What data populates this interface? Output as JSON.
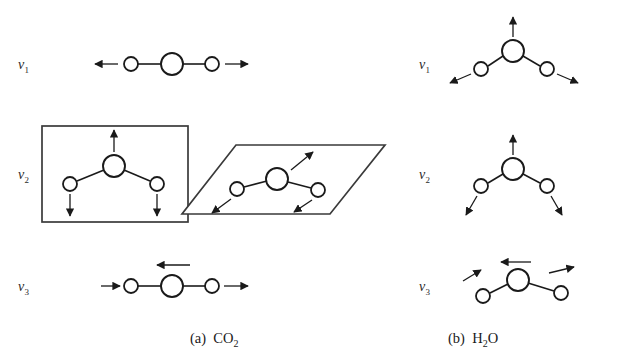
{
  "figure": {
    "panels": [
      {
        "id": "panel-a",
        "caption_prefix": "(a)",
        "molecule_formula": "CO",
        "molecule_sub": "2",
        "geometry": "linear",
        "modes": [
          {
            "label_nu": "ν",
            "label_sub": "1",
            "name": "symmetric-stretch",
            "atoms": [
              {
                "role": "outer",
                "cx": 131,
                "cy": 64,
                "r": 7
              },
              {
                "role": "center",
                "cx": 172,
                "cy": 64,
                "r": 11
              },
              {
                "role": "outer",
                "cx": 212,
                "cy": 64,
                "r": 7
              }
            ],
            "bonds": [
              [
                138,
                64,
                161,
                64
              ],
              [
                183,
                64,
                205,
                64
              ]
            ],
            "arrows": [
              {
                "x1": 118,
                "y1": 64,
                "x2": 95,
                "y2": 64
              },
              {
                "x1": 225,
                "y1": 64,
                "x2": 248,
                "y2": 64
              }
            ],
            "boxes": []
          },
          {
            "label_nu": "ν",
            "label_sub": "2",
            "name": "bend-degenerate-pair",
            "atoms": [
              {
                "role": "outer",
                "cx": 70,
                "cy": 184,
                "r": 7
              },
              {
                "role": "center",
                "cx": 114,
                "cy": 166,
                "r": 11
              },
              {
                "role": "outer",
                "cx": 157,
                "cy": 184,
                "r": 7
              }
            ],
            "bonds": [
              [
                77,
                181,
                104,
                170
              ],
              [
                124,
                170,
                150,
                181
              ]
            ],
            "arrows": [
              {
                "x1": 114,
                "y1": 152,
                "x2": 114,
                "y2": 128
              },
              {
                "x1": 70,
                "y1": 194,
                "x2": 70,
                "y2": 217
              },
              {
                "x1": 157,
                "y1": 194,
                "x2": 157,
                "y2": 217
              }
            ],
            "boxes": [
              {
                "type": "rect",
                "x": 42,
                "y": 126,
                "w": 146,
                "h": 96
              }
            ],
            "second": {
              "name": "bend-perpendicular-plane",
              "atoms": [
                {
                  "role": "outer",
                  "cx": 237,
                  "cy": 189,
                  "r": 7
                },
                {
                  "role": "center",
                  "cx": 277,
                  "cy": 179,
                  "r": 11
                },
                {
                  "role": "outer",
                  "cx": 318,
                  "cy": 190,
                  "r": 7
                }
              ],
              "bonds": [
                [
                  244,
                  187,
                  267,
                  181
                ],
                [
                  288,
                  182,
                  311,
                  188
                ]
              ],
              "arrows": [
                {
                  "x1": 291,
                  "y1": 170,
                  "x2": 313,
                  "y2": 152
                },
                {
                  "x1": 231,
                  "y1": 199,
                  "x2": 212,
                  "y2": 214
                },
                {
                  "x1": 312,
                  "y1": 200,
                  "x2": 294,
                  "y2": 213
                }
              ],
              "boxes": [
                {
                  "type": "parallelogram",
                  "points": "236,145 385,145 330,214 182,214"
                }
              ]
            }
          },
          {
            "label_nu": "ν",
            "label_sub": "3",
            "name": "asymmetric-stretch",
            "atoms": [
              {
                "role": "outer",
                "cx": 131,
                "cy": 286,
                "r": 7
              },
              {
                "role": "center",
                "cx": 172,
                "cy": 286,
                "r": 11
              },
              {
                "role": "outer",
                "cx": 212,
                "cy": 286,
                "r": 7
              }
            ],
            "bonds": [
              [
                138,
                286,
                161,
                286
              ],
              [
                183,
                286,
                205,
                286
              ]
            ],
            "arrows": [
              {
                "x1": 103,
                "y1": 286,
                "x2": 120,
                "y2": 286
              },
              {
                "x1": 190,
                "y1": 265,
                "x2": 156,
                "y2": 265
              },
              {
                "x1": 224,
                "y1": 286,
                "x2": 248,
                "y2": 286
              }
            ],
            "boxes": []
          }
        ]
      },
      {
        "id": "panel-b",
        "caption_prefix": "(b)",
        "molecule_formula": "H",
        "molecule_sub": "2",
        "molecule_formula_tail": "O",
        "geometry": "bent",
        "modes": [
          {
            "label_nu": "ν",
            "label_sub": "1",
            "name": "symmetric-stretch",
            "atoms": [
              {
                "role": "outer",
                "cx": 481,
                "cy": 69,
                "r": 7
              },
              {
                "role": "center",
                "cx": 513,
                "cy": 51,
                "r": 11
              },
              {
                "role": "outer",
                "cx": 547,
                "cy": 69,
                "r": 7
              }
            ],
            "bonds": [
              [
                488,
                66,
                503,
                56
              ],
              [
                523,
                56,
                540,
                66
              ]
            ],
            "arrows": [
              {
                "x1": 513,
                "y1": 37,
                "x2": 513,
                "y2": 16
              },
              {
                "x1": 471,
                "y1": 74,
                "x2": 450,
                "y2": 83
              },
              {
                "x1": 557,
                "y1": 74,
                "x2": 578,
                "y2": 83
              }
            ]
          },
          {
            "label_nu": "ν",
            "label_sub": "2",
            "name": "bend",
            "atoms": [
              {
                "role": "outer",
                "cx": 481,
                "cy": 186,
                "r": 7
              },
              {
                "role": "center",
                "cx": 513,
                "cy": 169,
                "r": 11
              },
              {
                "role": "outer",
                "cx": 547,
                "cy": 186,
                "r": 7
              }
            ],
            "bonds": [
              [
                488,
                183,
                503,
                174
              ],
              [
                523,
                174,
                540,
                183
              ]
            ],
            "arrows": [
              {
                "x1": 513,
                "y1": 155,
                "x2": 513,
                "y2": 134
              },
              {
                "x1": 477,
                "y1": 196,
                "x2": 465,
                "y2": 216
              },
              {
                "x1": 551,
                "y1": 196,
                "x2": 563,
                "y2": 216
              }
            ]
          },
          {
            "label_nu": "ν",
            "label_sub": "3",
            "name": "asymmetric-stretch",
            "atoms": [
              {
                "role": "outer",
                "cx": 483,
                "cy": 296,
                "r": 7
              },
              {
                "role": "center",
                "cx": 518,
                "cy": 280,
                "r": 11
              },
              {
                "role": "outer",
                "cx": 561,
                "cy": 293,
                "r": 7
              }
            ],
            "bonds": [
              [
                490,
                293,
                508,
                284
              ],
              [
                528,
                283,
                554,
                291
              ]
            ],
            "arrows": [
              {
                "x1": 462,
                "y1": 280,
                "x2": 481,
                "y2": 270
              },
              {
                "x1": 529,
                "y1": 262,
                "x2": 500,
                "y2": 262
              },
              {
                "x1": 549,
                "y1": 273,
                "x2": 574,
                "y2": 268
              }
            ]
          }
        ]
      }
    ],
    "labels": {
      "a_nu1": {
        "text_nu": "ν",
        "sub": "1",
        "x": 18,
        "y": 57
      },
      "a_nu2": {
        "text_nu": "ν",
        "sub": "2",
        "x": 18,
        "y": 167
      },
      "a_nu3": {
        "text_nu": "ν",
        "sub": "3",
        "x": 18,
        "y": 279
      },
      "b_nu1": {
        "text_nu": "ν",
        "sub": "1",
        "x": 419,
        "y": 57
      },
      "b_nu2": {
        "text_nu": "ν",
        "sub": "2",
        "x": 419,
        "y": 167
      },
      "b_nu3": {
        "text_nu": "ν",
        "sub": "3",
        "x": 419,
        "y": 279
      }
    },
    "captions": {
      "left": {
        "prefix": "(a)",
        "formula": "CO",
        "sub": "2",
        "x": 190,
        "y": 330
      },
      "right": {
        "prefix": "(b)",
        "formula": "H",
        "sub": "2",
        "tail": "O",
        "x": 448,
        "y": 330
      }
    },
    "colors": {
      "stroke": "#1a1a1a",
      "arrow": "#1a1a1a",
      "box": "#3a3a3a",
      "background": "#ffffff",
      "label": "#2a2a2a"
    }
  }
}
